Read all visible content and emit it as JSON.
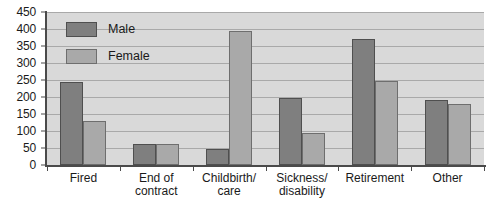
{
  "chart_data": {
    "type": "bar",
    "title": "",
    "subtitle": "",
    "xlabel": "",
    "ylabel": "",
    "ylim": [
      0,
      450
    ],
    "ytick_step": 50,
    "yticks": [
      0,
      50,
      100,
      150,
      200,
      250,
      300,
      350,
      400,
      450
    ],
    "ytick_labels": [
      "0",
      "50",
      "100",
      "150",
      "200",
      "250",
      "300",
      "350",
      "400",
      "450"
    ],
    "grid": true,
    "grid_axis": "y",
    "legend_position": "upper-left-inside",
    "categories": [
      "Fired",
      "End of contract",
      "Childbirth/ care",
      "Sickness/ disability",
      "Retirement",
      "Other"
    ],
    "category_lines": [
      [
        "Fired"
      ],
      [
        "End of",
        "contract"
      ],
      [
        "Childbirth/",
        "care"
      ],
      [
        "Sickness/",
        "disability"
      ],
      [
        "Retirement"
      ],
      [
        "Other"
      ]
    ],
    "series": [
      {
        "name": "Male",
        "color": "#7f7f7f",
        "values": [
          245,
          62,
          48,
          198,
          370,
          190
        ]
      },
      {
        "name": "Female",
        "color": "#a9a9a9",
        "values": [
          130,
          62,
          395,
          93,
          248,
          178
        ]
      }
    ]
  },
  "legend": {
    "items": [
      {
        "label": "Male",
        "swatch": "male-swatch"
      },
      {
        "label": "Female",
        "swatch": "female-swatch"
      }
    ]
  },
  "colors": {
    "male_fill": "#7f7f7f",
    "female_fill": "#a9a9a9",
    "plot_background": "#d9d9d9",
    "gridline": "#a9a9a9",
    "axis": "#4a4a4a",
    "text": "#1a1a1a",
    "page_background": "#ffffff"
  }
}
